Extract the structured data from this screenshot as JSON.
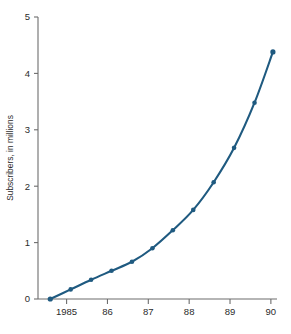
{
  "chart_data": {
    "type": "line",
    "title": "",
    "subtitle": "",
    "xlabel": "",
    "ylabel": "Subscribers, in millions",
    "xlim": [
      1984.3,
      1990.15
    ],
    "ylim": [
      0,
      5
    ],
    "grid": false,
    "legend": null,
    "x_tick_labels": [
      "1985",
      "86",
      "87",
      "88",
      "89",
      "90"
    ],
    "x_tick_values": [
      1985,
      1986,
      1987,
      1988,
      1989,
      1990
    ],
    "y_tick_labels": [
      "0",
      "1",
      "2",
      "3",
      "4",
      "5"
    ],
    "y_tick_values": [
      0,
      1,
      2,
      3,
      4,
      5
    ],
    "series": [
      {
        "name": "Subscribers",
        "color": "#1f5a80",
        "marker": "circle",
        "x": [
          1984.6,
          1985.1,
          1985.6,
          1986.1,
          1986.6,
          1987.1,
          1987.6,
          1988.1,
          1988.6,
          1989.1,
          1989.6,
          1990.05
        ],
        "values": [
          0.0,
          0.17,
          0.34,
          0.5,
          0.66,
          0.9,
          1.22,
          1.58,
          2.07,
          2.68,
          3.48,
          4.38
        ]
      }
    ]
  },
  "colors": {
    "series": "#1f5a80",
    "axis": "#6d6d6d",
    "text": "#2b2b2b",
    "background": "#ffffff"
  }
}
